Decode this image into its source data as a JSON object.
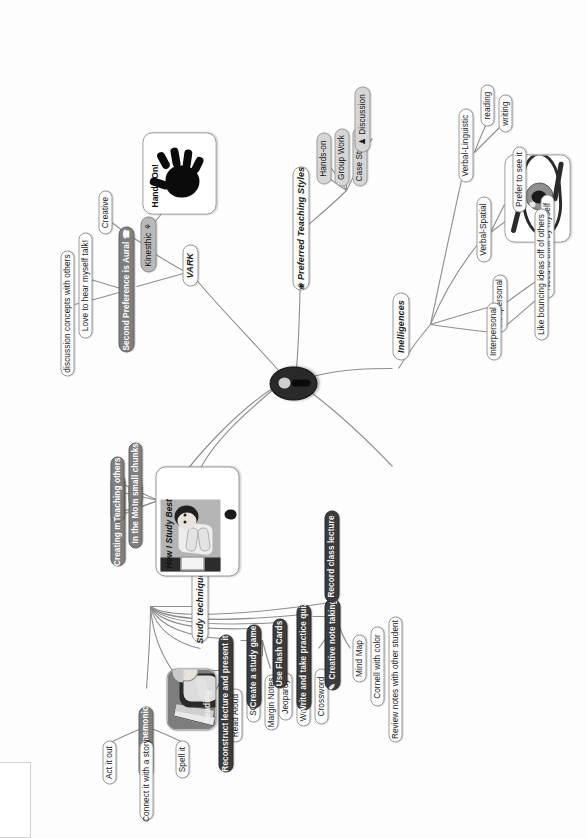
{
  "root": {
    "label": "",
    "icon": "person-icon"
  },
  "branches": {
    "study_techniques": {
      "label": "Study techniques",
      "children": [
        {
          "label": "Make it Mnemonic",
          "children": [
            {
              "label": "Act it out"
            },
            {
              "label": "Connect it with a story"
            },
            {
              "label": "Spell it"
            }
          ]
        },
        {
          "label": "Reading",
          "is_picture": true,
          "children": [
            {
              "label": "Read Aloud"
            },
            {
              "label": "SQ3R"
            },
            {
              "label": "Margin Notes"
            }
          ]
        },
        {
          "label": "Reconstruct lecture and present it"
        },
        {
          "label": "Create a study game",
          "children": [
            {
              "label": "Jeopardy"
            },
            {
              "label": "Word search"
            },
            {
              "label": "Crossword"
            }
          ]
        },
        {
          "label": "Use Flash Cards"
        },
        {
          "label": "Write and take practice quiz"
        },
        {
          "label": "Creative note taking",
          "icon": "pencil-icon",
          "children": [
            {
              "label": "Mind Map"
            },
            {
              "label": "Cornell with color"
            },
            {
              "label": "Review notes with other student"
            }
          ]
        },
        {
          "label": "Record class lecture"
        }
      ]
    },
    "how_i_study_best": {
      "label": "How I Study Best",
      "is_picture": true,
      "children": [
        {
          "label": "Creating my own exam"
        },
        {
          "label": "In the Morning"
        },
        {
          "label": "Teaching others"
        },
        {
          "label": "In small chunks"
        }
      ]
    },
    "vark": {
      "label": "VARK",
      "children": [
        {
          "label": "Second Preference is Aural",
          "icon": "phone-icon",
          "children": [
            {
              "label": "discussion concepts with others"
            },
            {
              "label": "Love to hear myself talk!"
            }
          ]
        },
        {
          "label": "Kinesthic",
          "icon": "runner-icon",
          "children": [
            {
              "label": "Creative"
            },
            {
              "label": "Hands-On!",
              "is_picture": true
            }
          ]
        }
      ]
    },
    "preferred_teaching_styles": {
      "label": "Preferred Teaching Styles",
      "icon": "apple-icon",
      "children": [
        {
          "label": "Case Studies"
        },
        {
          "label": "Group Work"
        },
        {
          "label": "Hands-on"
        },
        {
          "label": "Discussion",
          "icon": "people-icon"
        }
      ]
    },
    "intelligences": {
      "label": "Inelligences",
      "children": [
        {
          "label": "Verbal-Linguistic",
          "children": [
            {
              "label": "writing"
            },
            {
              "label": "reading"
            }
          ]
        },
        {
          "label": "Verbal-Spatial",
          "children": [
            {
              "label": "eye-picture",
              "is_picture": true
            },
            {
              "label": "Prefer to see it"
            }
          ]
        },
        {
          "label": "Intrapersonal",
          "children": [
            {
              "label": "Need to think by myself"
            }
          ]
        },
        {
          "label": "Interpersonal",
          "children": [
            {
              "label": "Like bouncing ideas off of others"
            }
          ]
        }
      ]
    }
  },
  "colors": {
    "dark_node": "#3b3b3b",
    "mid_node": "#7e7e7e",
    "gray_node": "#b9b9b9",
    "light_node": "#d6d6d6",
    "root": "#2a2a2a",
    "line": "#8d8d8d",
    "background": "#fdfdfd"
  },
  "icons": {
    "pencil": "✎",
    "phone": "☎",
    "runner": "⚘",
    "apple": "❀",
    "people": "♟"
  }
}
